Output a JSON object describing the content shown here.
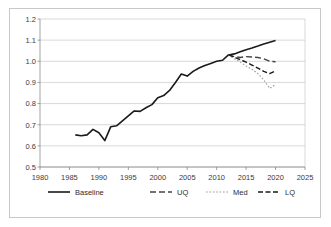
{
  "chart_data": {
    "type": "line",
    "title": "",
    "xlabel": "",
    "ylabel": "",
    "xlim": [
      1980,
      2025
    ],
    "ylim": [
      0.5,
      1.2
    ],
    "xticks": [
      1980,
      1985,
      1990,
      1995,
      2000,
      2005,
      2010,
      2015,
      2020,
      2025
    ],
    "yticks": [
      0.5,
      0.6,
      0.7,
      0.8,
      0.9,
      1.0,
      1.1,
      1.2
    ],
    "ytick_labels": [
      "0.5",
      "0.6",
      "0.7",
      "0.8",
      "0.9",
      "1.0",
      "1.1",
      "1.2"
    ],
    "xtick_labels": [
      "1980",
      "1985",
      "1990",
      "1995",
      "2000",
      "2005",
      "2010",
      "2015",
      "2020",
      "2025"
    ],
    "grid": "horizontal",
    "legend_position": "bottom",
    "series": [
      {
        "name": "Baseline",
        "style": "solid",
        "color": "#1a1a1a",
        "x": [
          1986,
          1987,
          1988,
          1989,
          1990,
          1991,
          1992,
          1993,
          1994,
          1995,
          1996,
          1997,
          1998,
          1999,
          2000,
          2001,
          2002,
          2003,
          2004,
          2005,
          2006,
          2007,
          2008,
          2009,
          2010,
          2011,
          2012,
          2013,
          2014,
          2015,
          2016,
          2017,
          2018,
          2019,
          2020
        ],
        "values": [
          0.652,
          0.648,
          0.652,
          0.678,
          0.662,
          0.625,
          0.69,
          0.695,
          0.718,
          0.742,
          0.765,
          0.763,
          0.78,
          0.795,
          0.828,
          0.838,
          0.862,
          0.9,
          0.94,
          0.93,
          0.952,
          0.968,
          0.98,
          0.99,
          1.0,
          1.005,
          1.03,
          1.035,
          1.045,
          1.055,
          1.063,
          1.072,
          1.082,
          1.09,
          1.098
        ]
      },
      {
        "name": "UQ",
        "style": "dashed",
        "color": "#444444",
        "x": [
          2012,
          2013,
          2014,
          2015,
          2016,
          2017,
          2018,
          2019,
          2020
        ],
        "values": [
          1.03,
          1.022,
          1.018,
          1.022,
          1.02,
          1.018,
          1.012,
          1.0,
          0.998
        ]
      },
      {
        "name": "Med",
        "style": "dotted",
        "color": "#9a9a9a",
        "x": [
          2012,
          2013,
          2014,
          2015,
          2016,
          2017,
          2018,
          2019,
          2020
        ],
        "values": [
          1.03,
          1.012,
          0.996,
          0.978,
          0.962,
          0.942,
          0.912,
          0.872,
          0.89
        ]
      },
      {
        "name": "LQ",
        "style": "dashdot",
        "color": "#1a1a1a",
        "x": [
          2012,
          2013,
          2014,
          2015,
          2016,
          2017,
          2018,
          2019,
          2020
        ],
        "values": [
          1.03,
          1.02,
          1.008,
          0.996,
          0.982,
          0.968,
          0.952,
          0.942,
          0.955
        ]
      }
    ],
    "legend": [
      {
        "label": "Baseline",
        "style": "solid",
        "color": "#1a1a1a"
      },
      {
        "label": "UQ",
        "style": "dashed",
        "color": "#444444"
      },
      {
        "label": "Med",
        "style": "dotted",
        "color": "#9a9a9a"
      },
      {
        "label": "LQ",
        "style": "dashdot",
        "color": "#1a1a1a"
      }
    ]
  }
}
